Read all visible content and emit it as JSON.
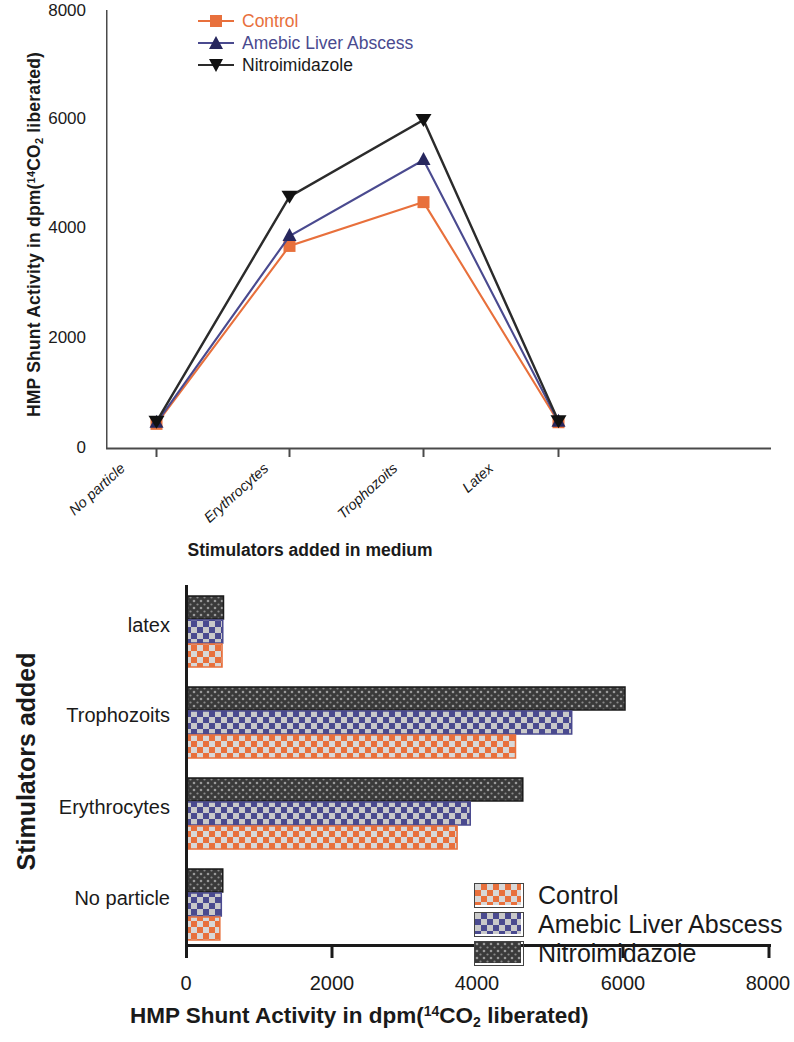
{
  "figure": {
    "colors": {
      "control": "#e8703c",
      "amebic_liver_abscess": "#4a4a8f",
      "nitroimidazole": "#2b2b2b",
      "axis": "#4a4a4a"
    }
  },
  "line_chart": {
    "y_axis_title_prefix": "HMP Shunt Activity in dpm(",
    "y_axis_title_sup": "14",
    "y_axis_title_mid": "CO",
    "y_axis_title_sub": "2",
    "y_axis_title_suffix": " liberated)",
    "x_axis_title": "Stimulators added in medium",
    "legend": [
      {
        "label": "Control",
        "marker": "square",
        "color": "#e8703c"
      },
      {
        "label": "Amebic Liver Abscess",
        "marker": "triangle-up",
        "color": "#4a4a8f"
      },
      {
        "label": "Nitroimidazole",
        "marker": "triangle-down",
        "color": "#2b2b2b"
      }
    ]
  },
  "bar_chart": {
    "y_axis_title": "Stimulators added",
    "x_axis_title_prefix": "HMP Shunt Activity in dpm(",
    "x_axis_title_sup": "14",
    "x_axis_title_mid": "CO",
    "x_axis_title_sub": "2",
    "x_axis_title_suffix": " liberated)",
    "legend": [
      {
        "label": "Control",
        "color": "#e8703c"
      },
      {
        "label": "Amebic Liver Abscess",
        "color": "#4a4a8f"
      },
      {
        "label": "Nitroimidazole",
        "color": "#2b2b2b"
      }
    ]
  },
  "chart_data": [
    {
      "type": "line",
      "title": "",
      "xlabel": "Stimulators added in medium",
      "ylabel": "HMP Shunt Activity in dpm(14CO2 liberated)",
      "categories": [
        "No particle",
        "Erythrocytes",
        "Trophozoits",
        "Latex"
      ],
      "ylim": [
        0,
        8000
      ],
      "yticks": [
        0,
        2000,
        4000,
        6000,
        8000
      ],
      "grid": false,
      "legend_position": "top-center",
      "series": [
        {
          "name": "Control",
          "color": "#e8703c",
          "marker": "square",
          "values": [
            450,
            3700,
            4500,
            480
          ]
        },
        {
          "name": "Amebic Liver Abscess",
          "color": "#4a4a8f",
          "marker": "triangle-up",
          "values": [
            470,
            3880,
            5270,
            490
          ]
        },
        {
          "name": "Nitroimidazole",
          "color": "#2b2b2b",
          "marker": "triangle-down",
          "values": [
            490,
            4600,
            6000,
            500
          ]
        }
      ]
    },
    {
      "type": "bar",
      "orientation": "horizontal",
      "title": "",
      "xlabel": "HMP Shunt Activity in dpm(14CO2 liberated)",
      "ylabel": "Stimulators added",
      "categories": [
        "No particle",
        "Erythrocytes",
        "Trophozoits",
        "latex"
      ],
      "xlim": [
        0,
        8000
      ],
      "xticks": [
        0,
        2000,
        4000,
        6000,
        8000
      ],
      "grid": false,
      "legend_position": "inside-lower-center",
      "series": [
        {
          "name": "Control",
          "color": "#e8703c",
          "pattern": "checker",
          "values": [
            450,
            3700,
            4500,
            480
          ]
        },
        {
          "name": "Amebic Liver Abscess",
          "color": "#4a4a8f",
          "pattern": "checker",
          "values": [
            470,
            3880,
            5270,
            490
          ]
        },
        {
          "name": "Nitroimidazole",
          "color": "#2b2b2b",
          "pattern": "dots",
          "values": [
            490,
            4600,
            6000,
            500
          ]
        }
      ]
    }
  ],
  "y_tick_labels_line": [
    "8000",
    "6000",
    "4000",
    "2000",
    "0"
  ],
  "x_tick_labels_line": [
    "No particle",
    "Erythrocytes",
    "Trophozoits",
    "Latex"
  ],
  "y_cat_labels_bar": [
    "latex",
    "Trophozoits",
    "Erythrocytes",
    "No particle"
  ],
  "x_tick_labels_bar": [
    "0",
    "2000",
    "4000",
    "6000",
    "8000"
  ]
}
